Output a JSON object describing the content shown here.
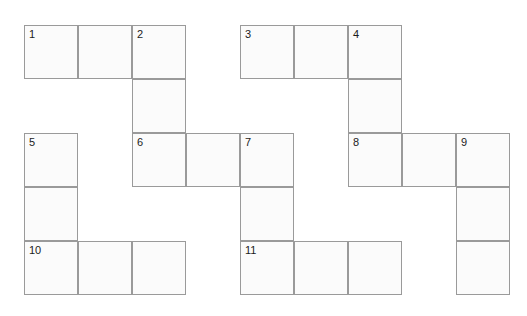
{
  "page": {
    "background_color": "#ffffff",
    "width": 527,
    "height": 316
  },
  "grid": {
    "cell_size": 54,
    "origin_x": 24,
    "origin_y": 25,
    "columns": 9,
    "rows": 5,
    "cell_fill_color": "#fbfbfb",
    "cell_border_color": "#9a9a9a",
    "number_color": "#1b1b1b",
    "cells": [
      {
        "id": "cell-r1c1",
        "col": 0,
        "row": 0,
        "number": "1"
      },
      {
        "id": "cell-r1c2",
        "col": 1,
        "row": 0,
        "number": ""
      },
      {
        "id": "cell-r1c3",
        "col": 2,
        "row": 0,
        "number": "2"
      },
      {
        "id": "cell-r1c5",
        "col": 4,
        "row": 0,
        "number": "3"
      },
      {
        "id": "cell-r1c6",
        "col": 5,
        "row": 0,
        "number": ""
      },
      {
        "id": "cell-r1c7",
        "col": 6,
        "row": 0,
        "number": "4"
      },
      {
        "id": "cell-r2c3",
        "col": 2,
        "row": 1,
        "number": ""
      },
      {
        "id": "cell-r2c7",
        "col": 6,
        "row": 1,
        "number": ""
      },
      {
        "id": "cell-r3c1",
        "col": 0,
        "row": 2,
        "number": "5"
      },
      {
        "id": "cell-r3c3",
        "col": 2,
        "row": 2,
        "number": "6"
      },
      {
        "id": "cell-r3c4",
        "col": 3,
        "row": 2,
        "number": ""
      },
      {
        "id": "cell-r3c5",
        "col": 4,
        "row": 2,
        "number": "7"
      },
      {
        "id": "cell-r3c7",
        "col": 6,
        "row": 2,
        "number": "8"
      },
      {
        "id": "cell-r3c8",
        "col": 7,
        "row": 2,
        "number": ""
      },
      {
        "id": "cell-r3c9",
        "col": 8,
        "row": 2,
        "number": "9"
      },
      {
        "id": "cell-r4c1",
        "col": 0,
        "row": 3,
        "number": ""
      },
      {
        "id": "cell-r4c5",
        "col": 4,
        "row": 3,
        "number": ""
      },
      {
        "id": "cell-r4c9",
        "col": 8,
        "row": 3,
        "number": ""
      },
      {
        "id": "cell-r5c1",
        "col": 0,
        "row": 4,
        "number": "10"
      },
      {
        "id": "cell-r5c2",
        "col": 1,
        "row": 4,
        "number": ""
      },
      {
        "id": "cell-r5c3",
        "col": 2,
        "row": 4,
        "number": ""
      },
      {
        "id": "cell-r5c5",
        "col": 4,
        "row": 4,
        "number": "11"
      },
      {
        "id": "cell-r5c6",
        "col": 5,
        "row": 4,
        "number": ""
      },
      {
        "id": "cell-r5c7",
        "col": 6,
        "row": 4,
        "number": ""
      },
      {
        "id": "cell-r5c9",
        "col": 8,
        "row": 4,
        "number": ""
      }
    ]
  }
}
